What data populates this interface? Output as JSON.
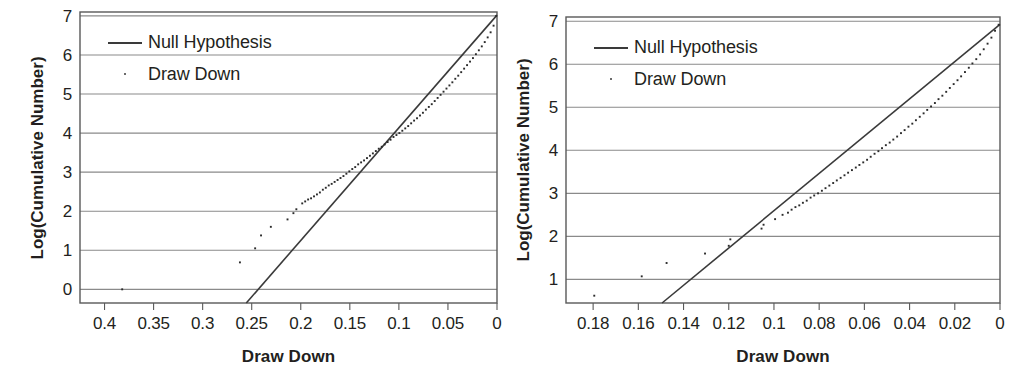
{
  "figure": {
    "background": "#ffffff",
    "ink": "#231f20",
    "line_color": "#3a3a3a",
    "grid_color": "#8a8a8a",
    "frame_color": "#595959"
  },
  "panels": [
    {
      "id": "left",
      "legend_position": "top-left",
      "legend": [
        {
          "key": "line",
          "label": "Null Hypothesis"
        },
        {
          "key": "dot",
          "label": "Draw Down"
        }
      ],
      "chart_data": {
        "type": "scatter",
        "title": "",
        "xlabel": "Draw Down",
        "ylabel": "Log(Cumulative Number)",
        "xlim": [
          0.425,
          0.0
        ],
        "ylim": [
          -0.35,
          7.1
        ],
        "x_reversed": true,
        "grid": "horizontal",
        "legend_position": "top-left",
        "xticks": [
          "0.4",
          "0.35",
          "0.3",
          "0.25",
          "0.2",
          "0.15",
          "0.1",
          "0.05",
          "0"
        ],
        "xtick_values": [
          0.4,
          0.35,
          0.3,
          0.25,
          0.2,
          0.15,
          0.1,
          0.05,
          0
        ],
        "yticks": [
          "0",
          "1",
          "2",
          "3",
          "4",
          "5",
          "6",
          "7"
        ],
        "ytick_values": [
          0,
          1,
          2,
          3,
          4,
          5,
          6,
          7
        ],
        "series": [
          {
            "name": "Null Hypothesis",
            "type": "line",
            "x": [
              0.2555,
              0.0
            ],
            "y": [
              -0.35,
              7.02
            ]
          },
          {
            "name": "Draw Down",
            "type": "scatter",
            "x": [
              0.382,
              0.262,
              0.2465,
              0.2405,
              0.2305,
              0.2135,
              0.2075,
              0.2045,
              0.1985,
              0.1955,
              0.1925,
              0.1895,
              0.1865,
              0.1835,
              0.1805,
              0.1775,
              0.1745,
              0.1715,
              0.1685,
              0.1655,
              0.1625,
              0.1595,
              0.1565,
              0.1535,
              0.1505,
              0.1475,
              0.1445,
              0.1415,
              0.1385,
              0.1355,
              0.1325,
              0.1295,
              0.1265,
              0.1235,
              0.1205,
              0.1175,
              0.1145,
              0.1115,
              0.1085,
              0.1055,
              0.1025,
              0.0995,
              0.0965,
              0.0935,
              0.0905,
              0.0875,
              0.0845,
              0.0815,
              0.0785,
              0.0755,
              0.0725,
              0.0695,
              0.0665,
              0.0635,
              0.0605,
              0.0575,
              0.0545,
              0.0515,
              0.0485,
              0.0455,
              0.0425,
              0.0395,
              0.0365,
              0.0335,
              0.0305,
              0.0275,
              0.0245,
              0.0215,
              0.0185,
              0.0155,
              0.0125,
              0.0095,
              0.0065,
              0.0035,
              0.0008
            ],
            "y": [
              0.0,
              0.69,
              1.05,
              1.38,
              1.6,
              1.79,
              1.95,
              2.05,
              2.2,
              2.25,
              2.3,
              2.33,
              2.38,
              2.43,
              2.48,
              2.55,
              2.6,
              2.66,
              2.7,
              2.75,
              2.8,
              2.85,
              2.9,
              2.96,
              3.02,
              3.08,
              3.13,
              3.2,
              3.25,
              3.3,
              3.36,
              3.42,
              3.48,
              3.54,
              3.6,
              3.65,
              3.71,
              3.77,
              3.83,
              3.9,
              3.95,
              4.0,
              4.06,
              4.12,
              4.18,
              4.25,
              4.32,
              4.38,
              4.45,
              4.52,
              4.6,
              4.67,
              4.74,
              4.82,
              4.9,
              4.98,
              5.06,
              5.14,
              5.22,
              5.3,
              5.39,
              5.47,
              5.56,
              5.65,
              5.74,
              5.83,
              5.92,
              6.02,
              6.12,
              6.22,
              6.33,
              6.45,
              6.58,
              6.75,
              7.0
            ]
          }
        ]
      }
    },
    {
      "id": "right",
      "legend_position": "top-left",
      "legend": [
        {
          "key": "line",
          "label": "Null Hypothesis"
        },
        {
          "key": "dot",
          "label": "Draw Down"
        }
      ],
      "chart_data": {
        "type": "scatter",
        "title": "",
        "xlabel": "Draw Down",
        "ylabel": "Log(Cumulative Number)",
        "xlim": [
          0.192,
          0.0
        ],
        "ylim": [
          0.45,
          7.1
        ],
        "x_reversed": true,
        "grid": "horizontal",
        "legend_position": "top-left",
        "xticks": [
          "0.18",
          "0.16",
          "0.14",
          "0.12",
          "0.1",
          "0.08",
          "0.06",
          "0.04",
          "0.02",
          "0"
        ],
        "xtick_values": [
          0.18,
          0.16,
          0.14,
          0.12,
          0.1,
          0.08,
          0.06,
          0.04,
          0.02,
          0
        ],
        "yticks": [
          "1",
          "2",
          "3",
          "4",
          "5",
          "6",
          "7"
        ],
        "ytick_values": [
          1,
          2,
          3,
          4,
          5,
          6,
          7
        ],
        "series": [
          {
            "name": "Null Hypothesis",
            "type": "line",
            "x": [
              0.1495,
              0.0
            ],
            "y": [
              0.45,
              6.93
            ]
          },
          {
            "name": "Draw Down",
            "type": "scatter",
            "x": [
              0.1795,
              0.1585,
              0.1475,
              0.1305,
              0.12,
              0.1193,
              0.1055,
              0.1046,
              0.0995,
              0.0962,
              0.0938,
              0.0922,
              0.0905,
              0.0888,
              0.0872,
              0.0855,
              0.0838,
              0.0822,
              0.0805,
              0.0788,
              0.0772,
              0.0755,
              0.0738,
              0.0722,
              0.0705,
              0.0688,
              0.0672,
              0.0655,
              0.0638,
              0.0622,
              0.0605,
              0.0588,
              0.0572,
              0.0555,
              0.0538,
              0.0522,
              0.0505,
              0.0488,
              0.0472,
              0.0455,
              0.0438,
              0.0422,
              0.0405,
              0.0388,
              0.0372,
              0.0355,
              0.0338,
              0.0322,
              0.0305,
              0.0288,
              0.0272,
              0.0255,
              0.0238,
              0.0222,
              0.0205,
              0.0188,
              0.0172,
              0.0155,
              0.0138,
              0.0122,
              0.0105,
              0.0088,
              0.0072,
              0.0055,
              0.0038,
              0.0022,
              0.0006
            ],
            "y": [
              0.62,
              1.07,
              1.38,
              1.6,
              1.78,
              1.93,
              2.18,
              2.27,
              2.4,
              2.5,
              2.55,
              2.62,
              2.68,
              2.72,
              2.78,
              2.83,
              2.9,
              2.95,
              3.0,
              3.06,
              3.12,
              3.18,
              3.24,
              3.3,
              3.36,
              3.42,
              3.48,
              3.54,
              3.6,
              3.66,
              3.72,
              3.78,
              3.85,
              3.92,
              3.98,
              4.05,
              4.12,
              4.18,
              4.25,
              4.32,
              4.4,
              4.47,
              4.55,
              4.62,
              4.7,
              4.78,
              4.86,
              4.94,
              5.02,
              5.1,
              5.19,
              5.27,
              5.36,
              5.45,
              5.54,
              5.63,
              5.72,
              5.82,
              5.92,
              6.02,
              6.12,
              6.23,
              6.35,
              6.48,
              6.62,
              6.78,
              6.92
            ]
          }
        ]
      }
    }
  ]
}
